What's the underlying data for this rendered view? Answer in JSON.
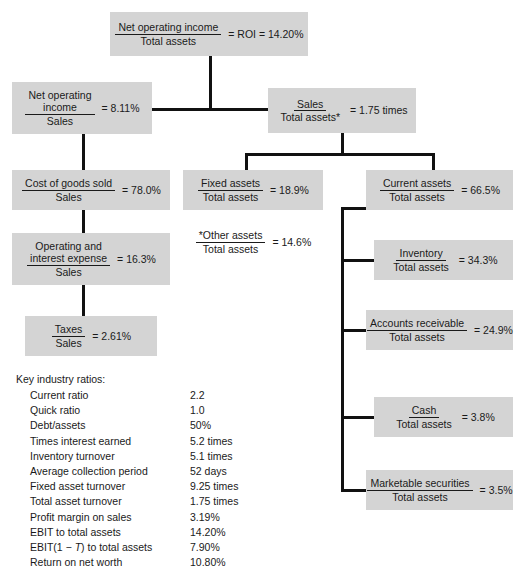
{
  "diagram": {
    "title_note": "ROI / Du Pont system of analysis chart",
    "nodes": {
      "roi": {
        "numerator": "Net operating income",
        "denominator": "Total assets",
        "result": "= ROI = 14.20%"
      },
      "profit_margin": {
        "numerator_line1": "Net operating",
        "numerator_line2": "income",
        "denominator": "Sales",
        "result": "= 8.11%"
      },
      "asset_turnover": {
        "numerator": "Sales",
        "denominator": "Total assets*",
        "result": "= 1.75 times"
      },
      "cogs": {
        "numerator": "Cost of goods sold",
        "denominator": "Sales",
        "result": "= 78.0%"
      },
      "fixed_assets": {
        "numerator": "Fixed assets",
        "denominator": "Total assets",
        "result": "= 18.9%"
      },
      "current_assets": {
        "numerator": "Current assets",
        "denominator": "Total assets",
        "result": "= 66.5%"
      },
      "operating_interest_expense": {
        "numerator_line1": "Operating and",
        "numerator_line2": "interest expense",
        "denominator": "Sales",
        "result": "= 16.3%"
      },
      "other_assets": {
        "numerator": "*Other assets",
        "denominator": "Total assets",
        "result": "= 14.6%"
      },
      "inventory": {
        "numerator": "Inventory",
        "denominator": "Total assets",
        "result": "= 34.3%"
      },
      "taxes": {
        "numerator": "Taxes",
        "denominator": "Sales",
        "result": "= 2.61%"
      },
      "accounts_receivable": {
        "numerator": "Accounts receivable",
        "denominator": "Total assets",
        "result": "= 24.9%"
      },
      "cash": {
        "numerator": "Cash",
        "denominator": "Total assets",
        "result": "= 3.8%"
      },
      "marketable_securities": {
        "numerator": "Marketable securities",
        "denominator": "Total assets",
        "result": "= 3.5%"
      }
    }
  },
  "key_ratios": {
    "title": "Key industry ratios:",
    "rows": [
      {
        "label": "Current ratio",
        "value": "2.2"
      },
      {
        "label": "Quick ratio",
        "value": "1.0"
      },
      {
        "label": "Debt/assets",
        "value": "50%"
      },
      {
        "label": "Times interest earned",
        "value": "5.2 times"
      },
      {
        "label": "Inventory turnover",
        "value": "5.1 times"
      },
      {
        "label": "Average collection period",
        "value": "52 days"
      },
      {
        "label": "Fixed asset turnover",
        "value": "9.25 times"
      },
      {
        "label": "Total asset turnover",
        "value": "1.75 times"
      },
      {
        "label": "Profit margin on sales",
        "value": "3.19%"
      },
      {
        "label": "EBIT to total assets",
        "value": "14.20%"
      },
      {
        "label": "EBIT(1 − T) to total assets",
        "value": "7.90%"
      },
      {
        "label": "Return on net worth",
        "value": "10.80%"
      }
    ]
  },
  "colors": {
    "box_fill": "#d4d4d4",
    "line": "#111111",
    "text": "#1a1a1a",
    "page_background": "#ffffff"
  }
}
